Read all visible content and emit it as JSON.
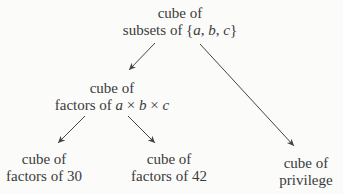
{
  "diagram": {
    "type": "tree",
    "nodes": {
      "root": {
        "line1": "cube of",
        "line2_prefix": "subsets of {",
        "line2_a": "a",
        "line2_sep1": ", ",
        "line2_b": "b",
        "line2_sep2": ", ",
        "line2_c": "c",
        "line2_suffix": "}"
      },
      "factors_abc": {
        "line1": "cube of",
        "line2_prefix": "factors of ",
        "line2_a": "a",
        "line2_times1": " × ",
        "line2_b": "b",
        "line2_times2": " × ",
        "line2_c": "c"
      },
      "factors_30": {
        "line1": "cube of",
        "line2": "factors of 30"
      },
      "factors_42": {
        "line1": "cube of",
        "line2": "factors of 42"
      },
      "privilege": {
        "line1": "cube of",
        "line2": "privilege"
      }
    },
    "edges": [
      {
        "from": "root",
        "to": "factors_abc"
      },
      {
        "from": "root",
        "to": "privilege"
      },
      {
        "from": "factors_abc",
        "to": "factors_30"
      },
      {
        "from": "factors_abc",
        "to": "factors_42"
      }
    ],
    "colors": {
      "text": "#3a3a3a",
      "arrow": "#444444",
      "background": "#fbfbfa"
    }
  }
}
